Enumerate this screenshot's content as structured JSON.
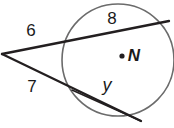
{
  "figure": {
    "type": "geometry-diagram",
    "background_color": "#ffffff",
    "stroke_color": "#231f20",
    "circle_stroke_color": "#6b6b6b",
    "labels": {
      "upper_outer_segment": "6",
      "upper_chord": "8",
      "lower_outer_segment": "7",
      "lower_chord": "y",
      "center_point": "N"
    },
    "center_dot": "center-point-dot",
    "circle": {
      "cx": 118,
      "cy": 60,
      "r": 56
    },
    "external_point": {
      "x": 2,
      "y": 54
    },
    "upper_secant": {
      "near_intersection": {
        "x": 68,
        "y": 40
      },
      "far_endpoint": {
        "x": 169,
        "y": 21
      }
    },
    "lower_secant": {
      "near_intersection": {
        "x": 72,
        "y": 90
      },
      "far_endpoint": {
        "x": 141,
        "y": 121
      }
    },
    "label_positions": {
      "upper_outer_segment": {
        "x": 31,
        "y": 30
      },
      "upper_chord": {
        "x": 112,
        "y": 18
      },
      "lower_outer_segment": {
        "x": 32,
        "y": 86
      },
      "lower_chord": {
        "x": 107,
        "y": 85
      },
      "center_point": {
        "x": 134,
        "y": 55
      },
      "center_dot": {
        "x": 122,
        "y": 56
      }
    }
  }
}
